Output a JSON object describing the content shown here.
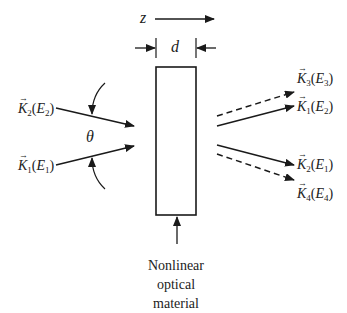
{
  "diagram": {
    "axis_label": "z",
    "thickness_label": "d",
    "angle_label": "θ",
    "material_caption": [
      "Nonlinear",
      "optical",
      "material"
    ],
    "input_beams": [
      {
        "vector": "K",
        "vector_index": "2",
        "field": "E",
        "field_index": "2",
        "style": "solid"
      },
      {
        "vector": "K",
        "vector_index": "1",
        "field": "E",
        "field_index": "1",
        "style": "solid"
      }
    ],
    "output_beams": [
      {
        "vector": "K",
        "vector_index": "3",
        "field": "E",
        "field_index": "3",
        "style": "dashed"
      },
      {
        "vector": "K",
        "vector_index": "1",
        "field": "E",
        "field_index": "2",
        "style": "solid"
      },
      {
        "vector": "K",
        "vector_index": "2",
        "field": "E",
        "field_index": "1",
        "style": "solid"
      },
      {
        "vector": "K",
        "vector_index": "4",
        "field": "E",
        "field_index": "4",
        "style": "dashed"
      }
    ],
    "colors": {
      "line": "#1a1a1a",
      "background": "#ffffff"
    }
  }
}
